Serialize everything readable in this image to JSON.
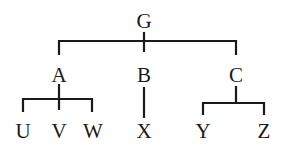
{
  "diagram": {
    "type": "tree",
    "root": {
      "label": "G",
      "children": [
        {
          "label": "A",
          "children": [
            {
              "label": "U"
            },
            {
              "label": "V"
            },
            {
              "label": "W"
            }
          ]
        },
        {
          "label": "B",
          "children": [
            {
              "label": "X"
            }
          ]
        },
        {
          "label": "C",
          "children": [
            {
              "label": "Y"
            },
            {
              "label": "Z"
            }
          ]
        }
      ]
    },
    "nodes": {
      "G": "G",
      "A": "A",
      "B": "B",
      "C": "C",
      "U": "U",
      "V": "V",
      "W": "W",
      "X": "X",
      "Y": "Y",
      "Z": "Z"
    },
    "colors": {
      "line": "#1a1a1a",
      "background": "#ffffff"
    }
  }
}
